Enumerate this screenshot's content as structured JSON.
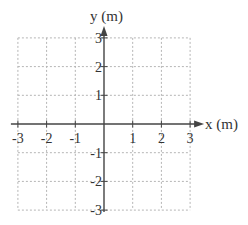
{
  "chart_data": {
    "type": "scatter",
    "title": "",
    "xlabel": "x (m)",
    "ylabel": "y (m)",
    "xlim": [
      -3,
      3
    ],
    "ylim": [
      -3,
      3
    ],
    "grid": true,
    "grid_style": "dotted",
    "x_ticks": [
      -3,
      -2,
      -1,
      1,
      2,
      3
    ],
    "y_ticks": [
      3,
      2,
      1,
      -1,
      -2,
      -3
    ],
    "x_tick_labels": [
      "-3",
      "-2",
      "-1",
      "1",
      "2",
      "3"
    ],
    "y_tick_labels": [
      "3",
      "2",
      "1",
      "-1",
      "-2",
      "-3"
    ],
    "series": [],
    "legend": null
  },
  "colors": {
    "axis": "#444444",
    "grid": "#b5b5b5",
    "text": "#333333",
    "background": "#ffffff"
  }
}
